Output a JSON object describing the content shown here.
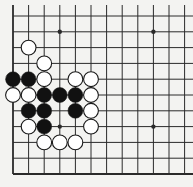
{
  "board": {
    "title": "Go board diagram (corner fragment)",
    "colors": {
      "background": "#f3f3f1",
      "line": "#2a2a2a",
      "black_stone": "#111111",
      "white_stone": "#ffffff",
      "stone_outline": "#1a1a1a"
    },
    "grid": {
      "origin_x": 13,
      "origin_y": 16,
      "spacing_x": 15.6,
      "spacing_y": 15.8,
      "cols": 12,
      "rows": 11,
      "left_edge": true,
      "bottom_edge": true,
      "top_open": true,
      "right_open": true
    },
    "hoshi": [
      {
        "col": 3,
        "row": 1
      },
      {
        "col": 9,
        "row": 1
      },
      {
        "col": 3,
        "row": 7
      },
      {
        "col": 9,
        "row": 7
      }
    ],
    "stones": [
      {
        "col": 1,
        "row": 2,
        "color": "white"
      },
      {
        "col": 2,
        "row": 3,
        "color": "white"
      },
      {
        "col": 0,
        "row": 4,
        "color": "black"
      },
      {
        "col": 1,
        "row": 4,
        "color": "black"
      },
      {
        "col": 2,
        "row": 4,
        "color": "white"
      },
      {
        "col": 4,
        "row": 4,
        "color": "white"
      },
      {
        "col": 5,
        "row": 4,
        "color": "white"
      },
      {
        "col": 0,
        "row": 5,
        "color": "white"
      },
      {
        "col": 1,
        "row": 5,
        "color": "white"
      },
      {
        "col": 2,
        "row": 5,
        "color": "black"
      },
      {
        "col": 3,
        "row": 5,
        "color": "black"
      },
      {
        "col": 4,
        "row": 5,
        "color": "black"
      },
      {
        "col": 5,
        "row": 5,
        "color": "white"
      },
      {
        "col": 1,
        "row": 6,
        "color": "black"
      },
      {
        "col": 2,
        "row": 6,
        "color": "black"
      },
      {
        "col": 4,
        "row": 6,
        "color": "black"
      },
      {
        "col": 5,
        "row": 6,
        "color": "white"
      },
      {
        "col": 1,
        "row": 7,
        "color": "white"
      },
      {
        "col": 2,
        "row": 7,
        "color": "black"
      },
      {
        "col": 5,
        "row": 7,
        "color": "white"
      },
      {
        "col": 2,
        "row": 8,
        "color": "white"
      },
      {
        "col": 3,
        "row": 8,
        "color": "white"
      },
      {
        "col": 4,
        "row": 8,
        "color": "white"
      }
    ]
  }
}
